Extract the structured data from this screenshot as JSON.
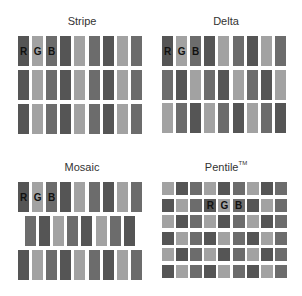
{
  "colors": {
    "R": "#555555",
    "G": "#a2a2a2",
    "B": "#6c6c6c"
  },
  "panels": [
    {
      "id": "stripe",
      "title": "Stripe",
      "rows": [
        [
          "R",
          "G",
          "B",
          "R",
          "G",
          "B",
          "R",
          "G",
          "B"
        ],
        [
          "R",
          "G",
          "B",
          "R",
          "G",
          "B",
          "R",
          "G",
          "B"
        ],
        [
          "R",
          "G",
          "B",
          "R",
          "G",
          "B",
          "R",
          "G",
          "B"
        ]
      ],
      "labels": {
        "row": 0,
        "cols": [
          0,
          1,
          2
        ],
        "text": [
          "R",
          "G",
          "B"
        ]
      }
    },
    {
      "id": "delta",
      "title": "Delta",
      "rows": [
        [
          "R",
          "G",
          "B",
          "R",
          "G",
          "B",
          "R",
          "G",
          "B"
        ],
        [
          "B",
          "R",
          "G",
          "B",
          "R",
          "G",
          "B",
          "R",
          "G"
        ],
        [
          "G",
          "B",
          "R",
          "G",
          "B",
          "R",
          "G",
          "B",
          "R"
        ]
      ],
      "labels": {
        "row": 0,
        "cols": [
          0,
          1,
          2
        ],
        "text": [
          "R",
          "G",
          "B"
        ]
      }
    },
    {
      "id": "mosaic",
      "title": "Mosaic",
      "rows": [
        [
          "R",
          "G",
          "B",
          "R",
          "G",
          "B",
          "R",
          "G",
          "B"
        ],
        [
          "B",
          "R",
          "G",
          "B",
          "R",
          "G",
          "B",
          "R"
        ],
        [
          "R",
          "G",
          "B",
          "R",
          "G",
          "B",
          "R",
          "G",
          "B"
        ]
      ],
      "labels": {
        "row": 0,
        "cols": [
          0,
          1,
          2
        ],
        "text": [
          "R",
          "G",
          "B"
        ]
      }
    },
    {
      "id": "pentile",
      "title": "Pentile",
      "title_suffix": "TM",
      "rows": [
        [
          "G",
          "R",
          "B",
          "G",
          "R",
          "B",
          "G",
          "R",
          "B"
        ],
        [
          "R",
          "G",
          "B",
          "R",
          "G",
          "B",
          "R",
          "G",
          "B"
        ],
        [
          "G",
          "R",
          "B",
          "G",
          "R",
          "B",
          "G",
          "R",
          "B"
        ],
        [
          "R",
          "G",
          "B",
          "R",
          "G",
          "B",
          "R",
          "G",
          "B"
        ],
        [
          "G",
          "R",
          "B",
          "G",
          "R",
          "B",
          "G",
          "R",
          "B"
        ],
        [
          "R",
          "G",
          "B",
          "R",
          "G",
          "B",
          "R",
          "G",
          "B"
        ]
      ],
      "labels": {
        "row": 1,
        "cols": [
          3,
          4,
          5
        ],
        "text": [
          "R",
          "G",
          "B"
        ]
      }
    }
  ]
}
